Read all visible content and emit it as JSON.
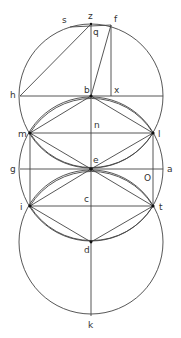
{
  "diagram": {
    "type": "geometric construction",
    "colors": {
      "line": "#444444",
      "label": "#333333",
      "background": "#ffffff"
    },
    "circles": [
      {
        "name": "upper-circle",
        "center": "b",
        "cx": 91,
        "cy": 96,
        "r": 72
      },
      {
        "name": "middle-circle",
        "center": "e",
        "cx": 91,
        "cy": 169,
        "r": 72
      },
      {
        "name": "lower-circle",
        "center": "d",
        "cx": 91,
        "cy": 242,
        "r": 72
      }
    ],
    "points": {
      "z": {
        "x": 91,
        "y": 24,
        "label": "z"
      },
      "s": {
        "x": 68,
        "y": 26,
        "label": "s"
      },
      "f": {
        "x": 111,
        "y": 26,
        "label": "f"
      },
      "q": {
        "x": 91,
        "y": 30,
        "label": "q"
      },
      "h": {
        "x": 20,
        "y": 96,
        "label": "h"
      },
      "b": {
        "x": 91,
        "y": 96,
        "label": "b"
      },
      "x": {
        "x": 111,
        "y": 96,
        "label": "x"
      },
      "m": {
        "x": 30,
        "y": 133,
        "label": "m"
      },
      "n": {
        "x": 91,
        "y": 133,
        "label": "n"
      },
      "l": {
        "x": 153,
        "y": 133,
        "label": "l"
      },
      "g": {
        "x": 20,
        "y": 169,
        "label": "g"
      },
      "e": {
        "x": 91,
        "y": 169,
        "label": "e"
      },
      "o": {
        "x": 147,
        "y": 169,
        "label": "O"
      },
      "a": {
        "x": 163,
        "y": 169,
        "label": "a"
      },
      "i": {
        "x": 30,
        "y": 206,
        "label": "i"
      },
      "c": {
        "x": 91,
        "y": 206,
        "label": "c"
      },
      "t": {
        "x": 153,
        "y": 206,
        "label": "t"
      },
      "d": {
        "x": 91,
        "y": 242,
        "label": "d"
      },
      "k": {
        "x": 91,
        "y": 316,
        "label": "k"
      }
    }
  }
}
